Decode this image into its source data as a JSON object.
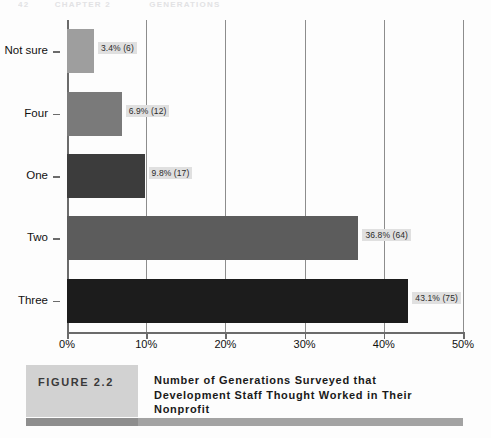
{
  "page_header": {
    "page_number": "42",
    "book_part": "CHAPTER 2",
    "section": "GENERATIONS"
  },
  "chart_data": {
    "type": "bar",
    "orientation": "horizontal",
    "title": "",
    "xlabel": "",
    "ylabel": "",
    "categories": [
      "Not sure",
      "Four",
      "One",
      "Two",
      "Three"
    ],
    "values": [
      3.4,
      6.9,
      9.8,
      36.8,
      43.1
    ],
    "counts": [
      6,
      12,
      17,
      64,
      75
    ],
    "data_labels": [
      "3.4% (6)",
      "6.9% (12)",
      "9.8% (17)",
      "36.8% (64)",
      "43.1% (75)"
    ],
    "bar_colors": [
      "#9e9e9e",
      "#7a7a7a",
      "#3c3c3c",
      "#5c5c5c",
      "#1c1c1c"
    ],
    "xlim": [
      0,
      50
    ],
    "xticks": [
      0,
      10,
      20,
      30,
      40,
      50
    ],
    "xtick_labels": [
      "0%",
      "10%",
      "20%",
      "30%",
      "40%",
      "50%"
    ],
    "grid": true,
    "legend": false
  },
  "caption": {
    "figure_tag": "FIGURE 2.2",
    "title": "Number of Generations Surveyed that Development Staff Thought Worked in Their Nonprofit"
  }
}
